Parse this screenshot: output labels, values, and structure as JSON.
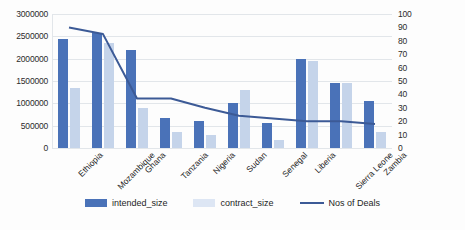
{
  "chart_data": {
    "type": "bar",
    "title": "",
    "xlabel": "",
    "ylabel": "",
    "grid": true,
    "legend_position": "bottom",
    "categories": [
      "Ethiopia",
      "Mozambique",
      "Ghana",
      "Tanzania",
      "Nigeria",
      "Sudan",
      "Senegal",
      "Liberia",
      "Sierra Leone",
      "Zambia"
    ],
    "ylim": [
      0,
      3000000
    ],
    "y_ticks": [
      "0",
      "500000",
      "1000000",
      "1500000",
      "2000000",
      "2500000",
      "3000000"
    ],
    "y2lim": [
      0,
      100
    ],
    "y2_ticks": [
      "0",
      "10",
      "20",
      "30",
      "40",
      "50",
      "60",
      "70",
      "80",
      "90",
      "100"
    ],
    "series": [
      {
        "name": "intended_size",
        "type": "bar",
        "axis": "left",
        "color": "#4a72b8",
        "values": [
          2450000,
          2570000,
          2200000,
          680000,
          600000,
          1000000,
          550000,
          2000000,
          1450000,
          1050000
        ]
      },
      {
        "name": "contract_size",
        "type": "bar",
        "axis": "left",
        "color": "#c5d4ea",
        "values": [
          1350000,
          2350000,
          900000,
          350000,
          300000,
          1300000,
          180000,
          1950000,
          1450000,
          350000
        ]
      },
      {
        "name": "Nos of Deals",
        "type": "line",
        "axis": "right",
        "color": "#3c5a96",
        "values": [
          90,
          85,
          37,
          37,
          30,
          24,
          22,
          20,
          20,
          18
        ]
      }
    ]
  },
  "legend": {
    "items": [
      {
        "label": "intended_size",
        "marker": "square-dark-blue"
      },
      {
        "label": "contract_size",
        "marker": "square-light-blue"
      },
      {
        "label": "Nos of Deals",
        "marker": "line-blue"
      }
    ]
  }
}
